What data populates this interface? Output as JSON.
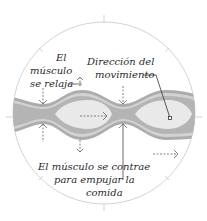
{
  "diagram": {
    "labels": {
      "relax_line1": "El",
      "relax_line2": "músculo",
      "relax_line3": "se relaja",
      "direction_line1": "Dirección del",
      "direction_line2": "movimiento",
      "contract_line1": "El músculo se contrae",
      "contract_line2": "para empujar la",
      "contract_line3": "comida"
    },
    "colors": {
      "circle": "#c8c8c8",
      "muscle_outer": "#a9a9a9",
      "muscle_band": "#d4d4d4",
      "lumen": "#e6e6e6",
      "food": "#eeeeee",
      "arrows": "#555555",
      "text": "#2a2a2a"
    },
    "icons": [
      "dashed-arrow-right",
      "dashed-arrow-down",
      "dashed-arrow-up",
      "leader-line"
    ]
  }
}
